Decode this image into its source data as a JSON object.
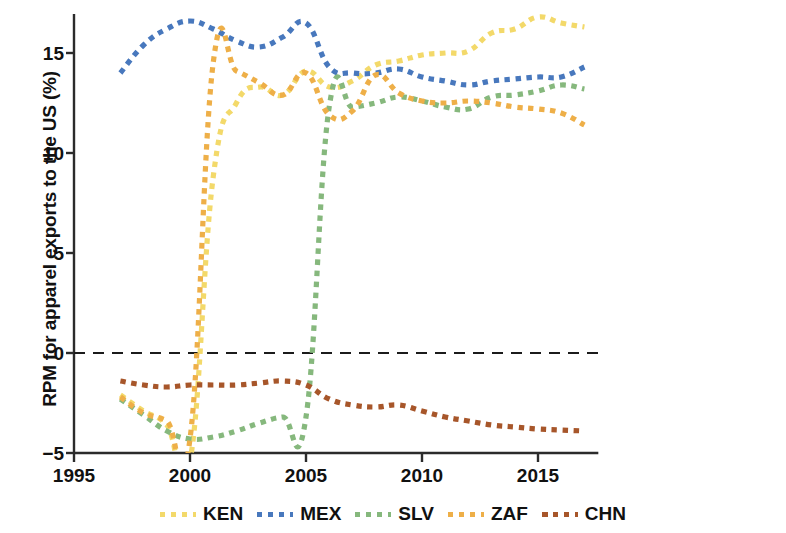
{
  "chart_data": {
    "type": "line",
    "title": "",
    "xlabel": "",
    "ylabel": "RPM for apparel exports to the US (%)",
    "xlim": [
      1995,
      2017.6
    ],
    "ylim": [
      -5,
      17.2
    ],
    "xticks": [
      1995,
      2000,
      2005,
      2010,
      2015
    ],
    "xtick_labels": [
      "1995",
      "2000",
      "2005",
      "2010",
      "2015"
    ],
    "yticks": [
      -5,
      0,
      5,
      10,
      15
    ],
    "ytick_labels": [
      "−5",
      "0",
      "5",
      "10",
      "15"
    ],
    "grid": false,
    "zero_line": true,
    "legend_position": "bottom",
    "line_style": "dashed",
    "series": [
      {
        "name": "KEN",
        "color": "#f3d96a",
        "x": [
          1997,
          1998,
          1999,
          2000,
          2001,
          2002,
          2003,
          2004,
          2005,
          2006,
          2007,
          2008,
          2009,
          2010,
          2011,
          2012,
          2013,
          2014,
          2015,
          2016,
          2017
        ],
        "values": [
          -2.1,
          -2.9,
          -3.6,
          -5.4,
          8.8,
          12.5,
          13.3,
          12.9,
          14.1,
          13.3,
          13.6,
          14.4,
          14.6,
          14.9,
          15.0,
          15.1,
          16.0,
          16.2,
          16.8,
          16.5,
          16.3
        ]
      },
      {
        "name": "MEX",
        "color": "#4878bd",
        "x": [
          1997,
          1998,
          1999,
          2000,
          2001,
          2002,
          2003,
          2004,
          2005,
          2006,
          2007,
          2008,
          2009,
          2010,
          2011,
          2012,
          2013,
          2014,
          2015,
          2016,
          2017
        ],
        "values": [
          14.0,
          15.4,
          16.2,
          16.6,
          16.2,
          15.6,
          15.3,
          15.8,
          16.5,
          14.3,
          14.0,
          14.0,
          14.2,
          13.8,
          13.6,
          13.4,
          13.6,
          13.7,
          13.8,
          13.8,
          14.3
        ]
      },
      {
        "name": "SLV",
        "color": "#86b87d",
        "x": [
          1997,
          1998,
          1999,
          2000,
          2001,
          2002,
          2003,
          2004,
          2005,
          2006,
          2007,
          2008,
          2009,
          2010,
          2011,
          2012,
          2013,
          2014,
          2015,
          2016,
          2017
        ],
        "values": [
          -2.3,
          -3.1,
          -3.9,
          -4.3,
          -4.2,
          -3.9,
          -3.5,
          -3.2,
          -3.2,
          12.3,
          12.3,
          12.5,
          12.8,
          12.6,
          12.3,
          12.2,
          12.8,
          12.9,
          13.1,
          13.4,
          13.2
        ]
      },
      {
        "name": "ZAF",
        "color": "#eeaf48",
        "x": [
          1997,
          1998,
          1999,
          2000,
          2001,
          2002,
          2003,
          2004,
          2005,
          2006,
          2007,
          2008,
          2009,
          2010,
          2011,
          2012,
          2013,
          2014,
          2015,
          2016,
          2017
        ],
        "values": [
          -2.2,
          -3.0,
          -3.4,
          -4.3,
          14.5,
          14.1,
          13.5,
          12.9,
          14.0,
          11.9,
          12.1,
          13.9,
          13.0,
          12.6,
          12.5,
          12.6,
          12.5,
          12.3,
          12.2,
          12.0,
          11.4
        ]
      },
      {
        "name": "CHN",
        "color": "#a7562a",
        "x": [
          1997,
          1998,
          1999,
          2000,
          2001,
          2002,
          2003,
          2004,
          2005,
          2006,
          2007,
          2008,
          2009,
          2010,
          2011,
          2012,
          2013,
          2014,
          2015,
          2016,
          2017
        ],
        "values": [
          -1.4,
          -1.6,
          -1.7,
          -1.6,
          -1.6,
          -1.6,
          -1.5,
          -1.4,
          -1.6,
          -2.3,
          -2.6,
          -2.7,
          -2.6,
          -2.9,
          -3.2,
          -3.4,
          -3.6,
          -3.7,
          -3.8,
          -3.85,
          -3.9
        ]
      }
    ]
  },
  "legend": {
    "items": [
      {
        "label": "KEN",
        "color": "#f3d96a"
      },
      {
        "label": "MEX",
        "color": "#4878bd"
      },
      {
        "label": "SLV",
        "color": "#86b87d"
      },
      {
        "label": "ZAF",
        "color": "#eeaf48"
      },
      {
        "label": "CHN",
        "color": "#a7562a"
      }
    ]
  },
  "axis_color": "#2b2b2b"
}
